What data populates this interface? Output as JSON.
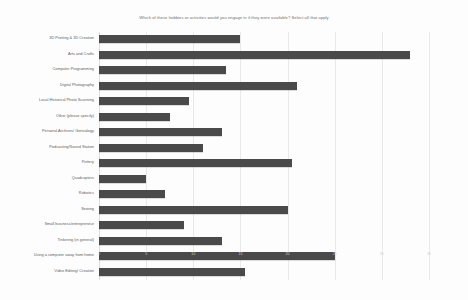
{
  "chart_data": {
    "type": "bar",
    "orientation": "horizontal",
    "title": "Which of these hobbies or activities would you engage in if they were available? Select all that apply",
    "xlabel": "",
    "ylabel": "",
    "xlim": [
      0,
      35
    ],
    "grid": true,
    "legend": "none",
    "bar_color": "#4a4a4a",
    "background_color": "#fdfdfd",
    "gridline_color": "#e9e9e9",
    "xticks": [
      "0",
      "5",
      "10",
      "15",
      "20",
      "25",
      "30",
      "35"
    ],
    "categories": [
      "3D Printing & 3D Creation",
      "Arts and Crafts",
      "Computer Programming",
      "Digital Photography",
      "Local Historical Photo Scanning",
      "Other (please specify)",
      "Personal Archives/ Genealogy",
      "Podcasting/Sound Station",
      "Pottery",
      "Quadcopters",
      "Robotics",
      "Sewing",
      "Small business/entrepreneur",
      "Tinkering (in general)",
      "Using a computer away from home",
      "Video Editing/ Creation"
    ],
    "values": [
      15,
      33,
      13.5,
      21,
      9.5,
      7.5,
      13,
      11,
      20.5,
      5,
      7,
      20,
      9,
      13,
      25,
      15.5
    ]
  }
}
